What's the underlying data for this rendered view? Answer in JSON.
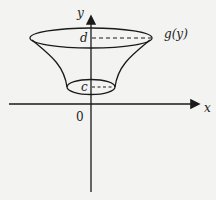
{
  "figure": {
    "type": "surface of revolution about y-axis",
    "axes": {
      "x_label": "x",
      "y_label": "y",
      "origin_label": "0"
    },
    "curve_label": "g(y)",
    "bounds": {
      "lower": "c",
      "upper": "d"
    },
    "colors": {
      "stroke": "#1a1a1a",
      "background": "#f3f3f1"
    }
  }
}
